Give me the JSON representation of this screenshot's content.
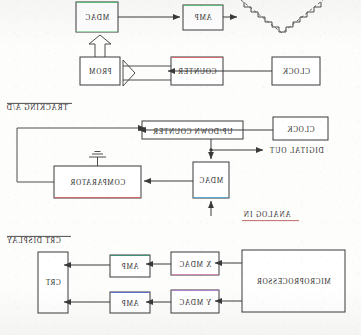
{
  "page": {
    "kind": "scanned-block-diagrams",
    "orientation": "mirrored-horizontally",
    "background_color": "#fdfdfc",
    "ink_color": "#3a3a3a",
    "width": 361,
    "height": 335
  },
  "diagrams": [
    {
      "id": "waveform-generator",
      "title": "",
      "blocks": [
        {
          "key": "mdac",
          "label": "MDAC",
          "x": 76,
          "y": 2,
          "w": 42,
          "h": 30,
          "accent": "#5ec07a"
        },
        {
          "key": "amp",
          "label": "AMP",
          "x": 183,
          "y": 5,
          "w": 40,
          "h": 25,
          "accent": "#5ec07a"
        },
        {
          "key": "prom",
          "label": "PROM",
          "x": 80,
          "y": 57,
          "w": 40,
          "h": 28,
          "accent": ""
        },
        {
          "key": "counter",
          "label": "COUNTER",
          "x": 171,
          "y": 57,
          "w": 52,
          "h": 28,
          "accent": "#d46a6a"
        },
        {
          "key": "clock",
          "label": "CLOCK",
          "x": 272,
          "y": 57,
          "w": 48,
          "h": 28,
          "accent": ""
        }
      ],
      "output_waveform": "staircase-triangle"
    },
    {
      "id": "tracking-ad-converter",
      "title": "TRACKING A/D",
      "title_rule": "overline",
      "blocks": [
        {
          "key": "updown",
          "label": "UP/DOWN COUNTER",
          "x": 142,
          "y": 121,
          "w": 101,
          "h": 18,
          "accent": ""
        },
        {
          "key": "clock",
          "label": "CLOCK",
          "x": 273,
          "y": 117,
          "w": 55,
          "h": 23,
          "accent": ""
        },
        {
          "key": "comparator",
          "label": "COMPARATOR",
          "x": 54,
          "y": 166,
          "w": 87,
          "h": 32,
          "accent": "#d46a6a"
        },
        {
          "key": "mdac",
          "label": "MDAC",
          "x": 193,
          "y": 162,
          "w": 36,
          "h": 36,
          "accent": "#5aa8d0"
        }
      ],
      "labels": [
        {
          "key": "digital-out",
          "text": "DIGITAL OUT",
          "x": 258,
          "y": 151,
          "rule": "none"
        },
        {
          "key": "analog-in",
          "text": "ANALOG IN",
          "x": 237,
          "y": 214,
          "rule": "underline"
        }
      ]
    },
    {
      "id": "crt-display",
      "title": "CRT DISPLAY",
      "title_rule": "overline",
      "blocks": [
        {
          "key": "crt",
          "label": "CRT",
          "x": 38,
          "y": 252,
          "w": 30,
          "h": 61,
          "accent": ""
        },
        {
          "key": "amp-x",
          "label": "AMP",
          "x": 110,
          "y": 255,
          "w": 40,
          "h": 22,
          "accent": "#3f8f78"
        },
        {
          "key": "amp-y",
          "label": "AMP",
          "x": 110,
          "y": 292,
          "w": 40,
          "h": 21,
          "accent": "#5a6fd0"
        },
        {
          "key": "mdac-x",
          "label": "X MDAC",
          "x": 171,
          "y": 252,
          "w": 48,
          "h": 23,
          "accent": "#d489b5"
        },
        {
          "key": "mdac-y",
          "label": "Y MDAC",
          "x": 171,
          "y": 290,
          "w": 48,
          "h": 23,
          "accent": "#b07fc9"
        },
        {
          "key": "microprocessor",
          "label": "MICROPROCESSOR",
          "x": 242,
          "y": 250,
          "w": 103,
          "h": 62,
          "accent": ""
        }
      ]
    }
  ]
}
